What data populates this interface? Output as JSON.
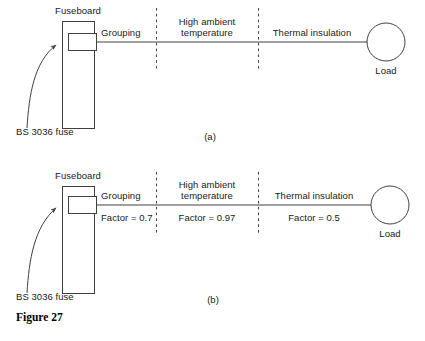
{
  "figure": {
    "caption": "Figure 27",
    "panels": [
      {
        "id": "a",
        "sublabel": "(a)",
        "fuseboard_label": "Fuseboard",
        "fuse_label": "BS 3036 fuse",
        "load_label": "Load",
        "zones": [
          {
            "name": "Grouping",
            "factor": ""
          },
          {
            "name": "High ambient temperature",
            "factor": ""
          },
          {
            "name": "Thermal insulation",
            "factor": ""
          }
        ]
      },
      {
        "id": "b",
        "sublabel": "(b)",
        "fuseboard_label": "Fuseboard",
        "fuse_label": "BS 3036 fuse",
        "load_label": "Load",
        "zones": [
          {
            "name": "Grouping",
            "factor": "Factor = 0.7"
          },
          {
            "name": "High ambient temperature",
            "factor": "Factor = 0.97"
          },
          {
            "name": "Thermal insulation",
            "factor": "Factor = 0.5"
          }
        ]
      }
    ]
  },
  "colors": {
    "stroke": "#404040",
    "text": "#1a1a1a",
    "background": "#ffffff"
  }
}
